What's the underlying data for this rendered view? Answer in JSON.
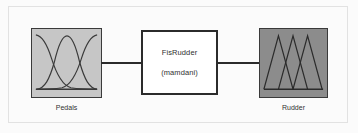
{
  "diagram": {
    "type": "fuzzy-inference-system-block-diagram",
    "background_color": "#fbfbfb",
    "input": {
      "label": "Pedals",
      "block_fill": "#c6c6c6",
      "border_color": "#3a3a3a",
      "membership_function_shape": "gaussian",
      "membership_function_count": 3,
      "curve_color": "#3a3a3a"
    },
    "system": {
      "name": "FisRudder",
      "inference_type": "(mamdani)",
      "block_fill": "#ffffff",
      "border_color": "#2b2b2b"
    },
    "output": {
      "label": "Rudder",
      "block_fill": "#8c8c8c",
      "border_color": "#3a3a3a",
      "membership_function_shape": "triangular",
      "membership_function_count": 3,
      "curve_color": "#2b2b2b"
    },
    "connectors": {
      "input_to_system": "line",
      "system_to_output": "line",
      "line_color": "#2b2b2b"
    }
  }
}
